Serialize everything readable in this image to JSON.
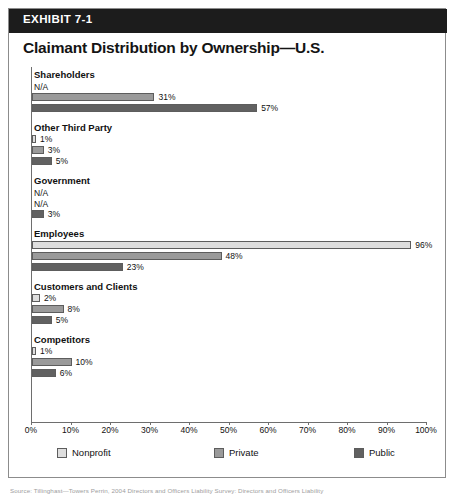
{
  "exhibit": {
    "badge": "EXHIBIT 7-1",
    "title": "Claimant Distribution by Ownership—U.S."
  },
  "chart_data": {
    "type": "bar",
    "orientation": "horizontal",
    "title": "Claimant Distribution by Ownership—U.S.",
    "xlabel": "",
    "ylabel": "",
    "xlim": [
      0,
      100
    ],
    "grid": false,
    "legend_position": "bottom",
    "tick_labels": [
      "0%",
      "10%",
      "20%",
      "30%",
      "40%",
      "50%",
      "60%",
      "70%",
      "80%",
      "90%",
      "100%"
    ],
    "tick_values": [
      0,
      10,
      20,
      30,
      40,
      50,
      60,
      70,
      80,
      90,
      100
    ],
    "categories": [
      "Shareholders",
      "Other Third Party",
      "Government",
      "Employees",
      "Customers and Clients",
      "Competitors"
    ],
    "series": [
      {
        "name": "Nonprofit",
        "color": "#dedede",
        "values": [
          null,
          1,
          null,
          96,
          2,
          1
        ],
        "labels": [
          "N/A",
          "1%",
          "N/A",
          "96%",
          "2%",
          "1%"
        ]
      },
      {
        "name": "Private",
        "color": "#9a9a9a",
        "values": [
          31,
          3,
          null,
          48,
          8,
          10
        ],
        "labels": [
          "31%",
          "3%",
          "N/A",
          "48%",
          "8%",
          "10%"
        ]
      },
      {
        "name": "Public",
        "color": "#616161",
        "values": [
          57,
          5,
          3,
          23,
          5,
          6
        ],
        "labels": [
          "57%",
          "5%",
          "3%",
          "23%",
          "5%",
          "6%"
        ]
      }
    ]
  },
  "legend": [
    {
      "label": "Nonprofit",
      "swatch": "sw-np"
    },
    {
      "label": "Private",
      "swatch": "sw-pv"
    },
    {
      "label": "Public",
      "swatch": "sw-pb"
    }
  ],
  "source": {
    "text": "Source: Tillinghast—Towers Perrin, 2004 Directors and Officers Liability Survey: Directors and Officers Liability"
  }
}
